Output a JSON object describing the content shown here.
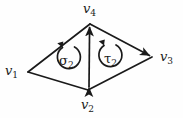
{
  "figure": {
    "type": "diagram",
    "background_color": "#fefefe",
    "stroke_color": "#1a1a1a",
    "vertices": [
      {
        "id": "v1",
        "label": "v",
        "subscript": "1",
        "x": 28,
        "y": 72,
        "label_position": "left"
      },
      {
        "id": "v2",
        "label": "v",
        "subscript": "2",
        "x": 88,
        "y": 90,
        "label_position": "below"
      },
      {
        "id": "v3",
        "label": "v",
        "subscript": "3",
        "x": 152,
        "y": 57,
        "label_position": "right"
      },
      {
        "id": "v4",
        "label": "v",
        "subscript": "4",
        "x": 90,
        "y": 24,
        "label_position": "above"
      }
    ],
    "edges": [
      {
        "from": "v1",
        "to": "v4",
        "arrowhead": "none"
      },
      {
        "from": "v1",
        "to": "v2",
        "arrowhead": "none"
      },
      {
        "from": "v2",
        "to": "v4",
        "arrowhead": "both"
      },
      {
        "from": "v4",
        "to": "v3",
        "arrowhead": "to"
      },
      {
        "from": "v2",
        "to": "v3",
        "arrowhead": "none"
      }
    ],
    "faces": [
      {
        "id": "sigma2",
        "label": "σ",
        "subscript": "2",
        "orientation": "counterclockwise",
        "center_x": 68,
        "center_y": 59
      },
      {
        "id": "tau2",
        "label": "τ",
        "subscript": "2",
        "orientation": "counterclockwise",
        "center_x": 110,
        "center_y": 57
      }
    ]
  }
}
